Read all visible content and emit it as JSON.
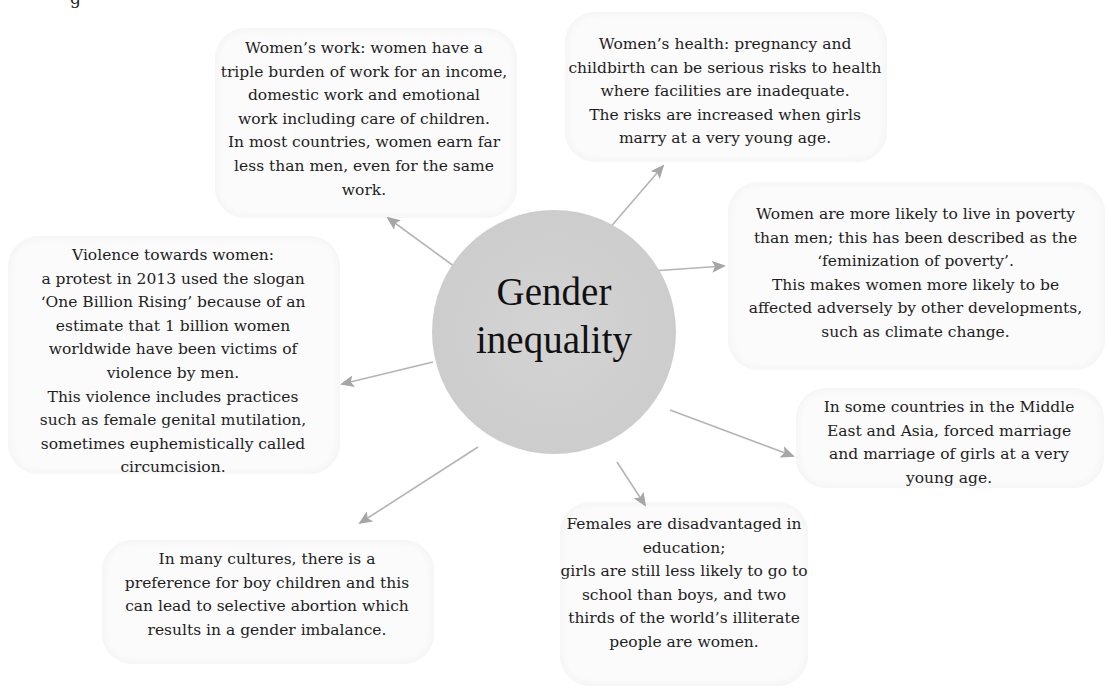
{
  "diagram": {
    "type": "mind-map",
    "top_cutoff_text": "g",
    "center": {
      "label": "Gender\ninequality",
      "fill": "#cfcfcf"
    },
    "arrow_color": "#a6a6a6",
    "nodes": [
      {
        "id": "work",
        "text": "Women’s work: women have a\ntriple burden of work for an income,\ndomestic work and emotional\nwork including care of children.\nIn most countries, women earn far\nless than men, even for the same\nwork."
      },
      {
        "id": "health",
        "text": "Women’s health: pregnancy and\nchildbirth can be serious risks to health\nwhere facilities are inadequate.\nThe risks are increased when girls\nmarry at a very young age."
      },
      {
        "id": "poverty",
        "text": "Women are more likely to live in poverty\nthan men; this has been described as the\n‘feminization of poverty’.\nThis makes women more likely to be\naffected adversely by other developments,\nsuch as climate change."
      },
      {
        "id": "violence",
        "text": "Violence towards women:\na protest in 2013 used the slogan\n‘One Billion Rising’ because of an\nestimate that 1 billion women\nworldwide have been victims of\nviolence by men.\nThis violence includes practices\nsuch as female genital mutilation,\nsometimes euphemistically called\ncircumcision."
      },
      {
        "id": "marriage",
        "text": "In some countries in the Middle\nEast and Asia, forced marriage\nand marriage of girls at a very\nyoung age."
      },
      {
        "id": "boy-preference",
        "text": "In many cultures, there is a\npreference for boy children and this\ncan lead to selective abortion which\nresults in a gender imbalance."
      },
      {
        "id": "education",
        "text": "Females are disadvantaged in\neducation;\ngirls are still less likely to go to\nschool than boys, and two\nthirds of the world’s illiterate\npeople are women."
      }
    ]
  }
}
